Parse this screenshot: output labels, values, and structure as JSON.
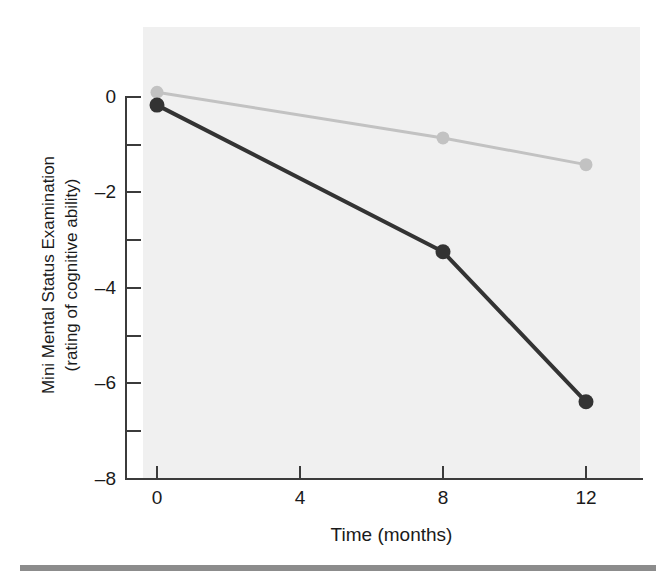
{
  "figure": {
    "top_clipped_caption": "",
    "bottom_rule_color": "#8c8c8c",
    "panel_color": "#f0f0f0"
  },
  "chart_data": {
    "type": "line",
    "title": "",
    "xlabel": "Time (months)",
    "ylabel_line1": "Mini Mental Status Examination",
    "ylabel_line2": "(rating of cognitive ability)",
    "x": [
      0,
      8,
      12
    ],
    "xlim": [
      -1.1,
      13.6
    ],
    "ylim": [
      -8.4,
      0.75
    ],
    "xticks": [
      0,
      4,
      8,
      12
    ],
    "xticklabels": [
      "0",
      "4",
      "8",
      "12"
    ],
    "yticks": [
      0,
      -2,
      -4,
      -6,
      -8
    ],
    "yticklabels": [
      "0",
      "–2",
      "–4",
      "–6",
      "–8"
    ],
    "y_minor_ticks": [
      -1,
      -3,
      -5,
      -7
    ],
    "grid": false,
    "legend": "none",
    "series": [
      {
        "name": "light-series",
        "color": "#c2c2c2",
        "marker": "circle",
        "marker_size": 13,
        "line_width": 3,
        "values": [
          0.1,
          -0.86,
          -1.42
        ]
      },
      {
        "name": "dark-series",
        "color": "#333333",
        "marker": "circle",
        "marker_size": 15,
        "line_width": 4,
        "values": [
          -0.17,
          -3.25,
          -6.4
        ]
      }
    ]
  }
}
